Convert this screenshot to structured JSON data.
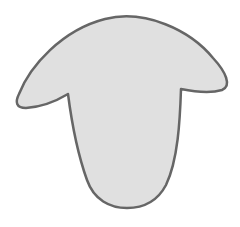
{
  "figure": {
    "shape": "sheep-head-silhouette",
    "fill_color": "#e0e0e0",
    "stroke_color": "#666666",
    "stroke_width": 2.5,
    "background_color": "#ffffff"
  }
}
